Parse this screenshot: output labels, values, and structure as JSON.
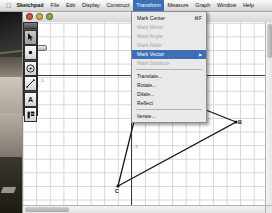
{
  "menubar": {
    "apple_icon": "apple-icon",
    "items": [
      {
        "label": "Sketchpad",
        "bold": true,
        "active": false
      },
      {
        "label": "File",
        "bold": false,
        "active": false
      },
      {
        "label": "Edit",
        "bold": false,
        "active": false
      },
      {
        "label": "Display",
        "bold": false,
        "active": false
      },
      {
        "label": "Construct",
        "bold": false,
        "active": false
      },
      {
        "label": "Transform",
        "bold": false,
        "active": true
      },
      {
        "label": "Measure",
        "bold": false,
        "active": false
      },
      {
        "label": "Graph",
        "bold": false,
        "active": false
      },
      {
        "label": "Window",
        "bold": false,
        "active": false
      },
      {
        "label": "Help",
        "bold": false,
        "active": false
      }
    ]
  },
  "window": {
    "title": "",
    "traffic_lights": [
      "close",
      "minimize",
      "zoom"
    ]
  },
  "transform_menu": {
    "groups": [
      [
        {
          "label": "Mark Center",
          "shortcut": "⌘F",
          "state": "normal"
        },
        {
          "label": "Mark Mirror",
          "shortcut": "",
          "state": "disabled"
        },
        {
          "label": "Mark Angle",
          "shortcut": "",
          "state": "disabled"
        },
        {
          "label": "Mark Ratio",
          "shortcut": "",
          "state": "disabled"
        },
        {
          "label": "Mark Vector",
          "shortcut": "",
          "state": "highlighted"
        },
        {
          "label": "Mark Distance",
          "shortcut": "",
          "state": "disabled"
        }
      ],
      [
        {
          "label": "Translate...",
          "shortcut": "",
          "state": "normal"
        },
        {
          "label": "Rotate...",
          "shortcut": "",
          "state": "normal"
        },
        {
          "label": "Dilate...",
          "shortcut": "",
          "state": "normal"
        },
        {
          "label": "Reflect",
          "shortcut": "",
          "state": "normal"
        }
      ],
      [
        {
          "label": "Iterate...",
          "shortcut": "",
          "state": "normal"
        }
      ]
    ]
  },
  "toolbar": {
    "tools": [
      {
        "name": "arrow-select-tool",
        "glyph": "arrow",
        "selected": true
      },
      {
        "name": "point-tool",
        "glyph": "point",
        "selected": false
      },
      {
        "name": "compass-circle-tool",
        "glyph": "circle",
        "selected": false
      },
      {
        "name": "straightedge-tool",
        "glyph": "line",
        "selected": false
      },
      {
        "name": "text-tool",
        "glyph": "A",
        "selected": false
      },
      {
        "name": "custom-tool",
        "glyph": "custom",
        "selected": false
      }
    ]
  },
  "canvas": {
    "axis_labels_x": [
      "-5",
      "5"
    ],
    "axis_labels_y": [
      "5",
      "-5"
    ],
    "points": [
      {
        "label": "A",
        "x": 120,
        "y": 63
      },
      {
        "label": "B",
        "x": 213,
        "y": 100
      },
      {
        "label": "C",
        "x": 95,
        "y": 164
      },
      {
        "label": "D",
        "x": 122,
        "y": 96
      },
      {
        "label": "E",
        "x": 125,
        "y": 22
      }
    ],
    "triangle": "A-B-C"
  },
  "colors": {
    "menu_highlight": "#3d6fb5",
    "grid_line": "#d6d6d6",
    "axis": "#3b3b3b",
    "geometry_stroke": "#1a1a1a"
  }
}
